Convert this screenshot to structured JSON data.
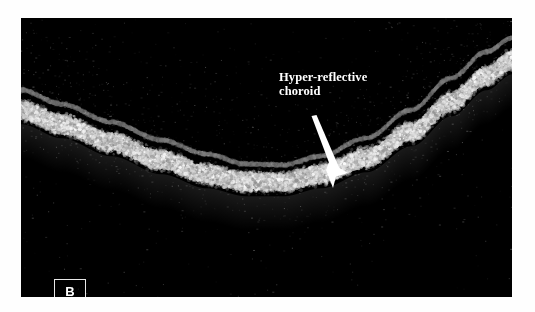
{
  "figure": {
    "panel_letter": "B",
    "modality": "OCT B-scan",
    "background_color": "#000000",
    "page_color": "#ffffff",
    "annotation_color": "#ffffff"
  },
  "annotation": {
    "line1": "Hyper-reflective",
    "line2": "choroid",
    "arrow_name": "pointer-arrow",
    "arrow_start": [
      292,
      100
    ],
    "arrow_tip": [
      325,
      158
    ]
  },
  "scan": {
    "panel_rect": [
      21,
      18,
      491,
      279
    ],
    "foveal_dip_x": 245,
    "foveal_dip_y": 165,
    "bands": [
      {
        "name": "inner-retinal-surface",
        "thickness": 5,
        "brightness": 0.55,
        "points": [
          [
            0,
            72
          ],
          [
            40,
            86
          ],
          [
            90,
            104
          ],
          [
            140,
            122
          ],
          [
            185,
            136
          ],
          [
            225,
            146
          ],
          [
            262,
            147
          ],
          [
            300,
            138
          ],
          [
            345,
            120
          ],
          [
            390,
            92
          ],
          [
            430,
            60
          ],
          [
            465,
            34
          ],
          [
            491,
            20
          ]
        ]
      },
      {
        "name": "hyper-reflective-choroid",
        "thickness": 26,
        "brightness": 1.0,
        "points": [
          [
            0,
            92
          ],
          [
            40,
            106
          ],
          [
            90,
            124
          ],
          [
            140,
            142
          ],
          [
            185,
            156
          ],
          [
            225,
            164
          ],
          [
            262,
            164
          ],
          [
            300,
            156
          ],
          [
            345,
            140
          ],
          [
            390,
            114
          ],
          [
            430,
            84
          ],
          [
            465,
            58
          ],
          [
            491,
            42
          ]
        ]
      }
    ]
  },
  "panel_label": {
    "text": "B",
    "box_rect": [
      33,
      261,
      32,
      24
    ]
  }
}
